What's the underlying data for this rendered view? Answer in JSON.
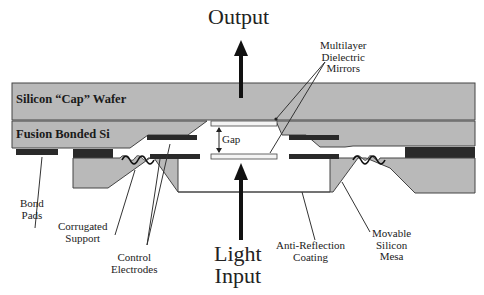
{
  "diagram": {
    "title_output": "Output",
    "title_input": [
      "Light",
      "Input"
    ],
    "layers": {
      "cap_wafer": "Silicon “Cap” Wafer",
      "fusion_bonded": "Fusion Bonded Si"
    },
    "labels": {
      "mirrors": [
        "Multilayer",
        "Dielectric",
        "Mirrors"
      ],
      "gap": "Gap",
      "bond_pads": [
        "Bond",
        "Pads"
      ],
      "corrugated_support": [
        "Corrugated",
        "Support"
      ],
      "control_electrodes": [
        "Control",
        "Electrodes"
      ],
      "anti_reflection": [
        "Anti-Reflection",
        "Coating"
      ],
      "movable_mesa": [
        "Movable",
        "Silicon",
        "Mesa"
      ]
    },
    "colors": {
      "silicon": "#b8b8b8",
      "electrode": "#2a2a2a",
      "outline": "#333333",
      "mirror": "#f4f4f4"
    }
  }
}
